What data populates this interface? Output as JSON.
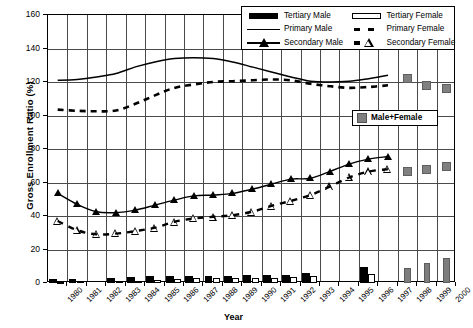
{
  "chart_data": {
    "type": "line",
    "title": "",
    "xlabel": "Year",
    "ylabel": "Gross Enrollment Ratio (%)",
    "ylim": [
      0,
      160
    ],
    "ytick_labels": [
      "0",
      "20",
      "40",
      "60",
      "80",
      "100",
      "120",
      "140",
      "160"
    ],
    "ytick_values": [
      0,
      20,
      40,
      60,
      80,
      100,
      120,
      140,
      160
    ],
    "grid": true,
    "legend_position": "top-right",
    "categories": [
      "1980",
      "1981",
      "1982",
      "1983",
      "1984",
      "1985",
      "1986",
      "1987",
      "1988",
      "1989",
      "1990",
      "1991",
      "1992",
      "1993",
      "1994",
      "1995",
      "1996",
      "1997",
      "1998",
      "1999",
      "2000"
    ],
    "series": [
      {
        "name": "Tertiary Male",
        "style": "bar",
        "color": "#000000",
        "values": [
          2.2,
          2.6,
          null,
          2.8,
          3.4,
          4.2,
          4.4,
          4.2,
          4.4,
          4.4,
          4.8,
          4.8,
          5.0,
          6.2,
          null,
          null,
          9.4,
          null,
          null,
          null,
          null
        ]
      },
      {
        "name": "Tertiary Female",
        "style": "bar",
        "color": "#ffffff",
        "values": [
          0.8,
          1.0,
          null,
          1.0,
          1.4,
          1.8,
          2.4,
          2.8,
          3.0,
          3.2,
          3.2,
          3.0,
          3.4,
          4.2,
          null,
          null,
          5.6,
          null,
          null,
          null,
          null
        ]
      },
      {
        "name": "Tertiary Male+Female",
        "style": "bar",
        "color": "#7d7d7d",
        "values": [
          null,
          null,
          null,
          null,
          null,
          null,
          null,
          null,
          null,
          null,
          null,
          null,
          null,
          null,
          null,
          null,
          null,
          null,
          9.0,
          12.2,
          15.2
        ]
      },
      {
        "name": "Primary Male",
        "style": "line",
        "color": "#000000",
        "values": [
          121,
          121.5,
          123,
          125,
          129,
          132,
          134,
          134.5,
          134,
          132,
          129,
          126,
          123,
          120.5,
          120,
          120.5,
          122,
          124,
          null,
          null,
          null
        ]
      },
      {
        "name": "Primary Female",
        "style": "dashed",
        "color": "#000000",
        "values": [
          103.5,
          102.8,
          102.5,
          103,
          107,
          112,
          116.5,
          118.5,
          120,
          120.5,
          121,
          121.5,
          121,
          119,
          117.5,
          116.5,
          117,
          118,
          null,
          null,
          null
        ]
      },
      {
        "name": "Primary Male+Female",
        "style": "square",
        "color": "#808080",
        "values": [
          null,
          null,
          null,
          null,
          null,
          null,
          null,
          null,
          null,
          null,
          null,
          null,
          null,
          null,
          null,
          null,
          null,
          null,
          122,
          118,
          116
        ]
      },
      {
        "name": "Secondary Male",
        "style": "line-triangle",
        "color": "#000000",
        "values": [
          53.5,
          47,
          42.5,
          42,
          43.5,
          46.5,
          49.5,
          52,
          52.5,
          53.5,
          56,
          59,
          62,
          62.5,
          66.5,
          71,
          74,
          75.5,
          null,
          null,
          null
        ]
      },
      {
        "name": "Secondary Female",
        "style": "dashed-triangle-open",
        "color": "#000000",
        "values": [
          37,
          31.5,
          29,
          29.5,
          31,
          33,
          36.5,
          38.5,
          39.5,
          40.5,
          42.5,
          46,
          49,
          52.5,
          57.5,
          63,
          66.5,
          68,
          null,
          null,
          null
        ]
      },
      {
        "name": "Secondary Male+Female",
        "style": "square",
        "color": "#808080",
        "values": [
          null,
          null,
          null,
          null,
          null,
          null,
          null,
          null,
          null,
          null,
          null,
          null,
          null,
          null,
          null,
          null,
          null,
          null,
          66.5,
          68,
          69.5
        ]
      }
    ]
  },
  "legend": {
    "entries": [
      {
        "label": "Tertiary Male",
        "key": "solid-bar"
      },
      {
        "label": "Tertiary Female",
        "key": "open-bar"
      },
      {
        "label": "Primary Male",
        "key": "solid-line"
      },
      {
        "label": "Primary Female",
        "key": "dashed-line"
      },
      {
        "label": "Secondary Male",
        "key": "line-filled-triangle"
      },
      {
        "label": "Secondary Female",
        "key": "dashed-open-triangle"
      }
    ],
    "male_female": {
      "label": "Male+Female",
      "key": "gray-square",
      "color": "#808080"
    }
  },
  "axes": {
    "y_title": "Gross Enrollment Ratio (%)",
    "x_title": "Year"
  }
}
